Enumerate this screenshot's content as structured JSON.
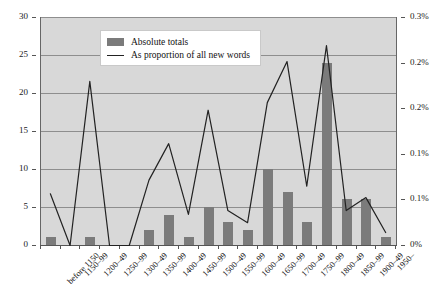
{
  "chart_data": {
    "type": "bar",
    "title": "",
    "subtitle": "",
    "xlabel": "",
    "ylabel": "",
    "y2label": "",
    "grid": true,
    "legend_position": "top-center-inside",
    "categories": [
      "before 1150",
      "1150–99",
      "1200–49",
      "1250–99",
      "1300–49",
      "1350–99",
      "1400–49",
      "1450–99",
      "1500–49",
      "1550–99",
      "1600–49",
      "1650–99",
      "1700–49",
      "1750–99",
      "1800–49",
      "1850–99",
      "1900–49",
      "1950–"
    ],
    "ylim": [
      0,
      30
    ],
    "yticks": [
      0,
      5,
      10,
      15,
      20,
      25,
      30
    ],
    "yticklabels": [
      "0",
      "5",
      "10",
      "15",
      "20",
      "25",
      "30"
    ],
    "y2lim": [
      0,
      0.3
    ],
    "y2ticks": [
      0,
      0.05,
      0.1,
      0.15,
      0.2,
      0.25,
      0.3
    ],
    "y2ticklabels": [
      "0%",
      "0.1%",
      "0.1%",
      "0.2%",
      "0.2%",
      "0.3%"
    ],
    "series": [
      {
        "name": "Absolute totals",
        "type": "bar",
        "axis": "left",
        "color": "#7b7b7b",
        "values": [
          1,
          0,
          1,
          0,
          0,
          2,
          4,
          1,
          5,
          3,
          2,
          10,
          7,
          3,
          24,
          6,
          6,
          1
        ]
      },
      {
        "name": "As proportion of all new words",
        "type": "line",
        "axis": "right",
        "color": "#222222",
        "values_left_scale": [
          6.8,
          0,
          21.6,
          0,
          0,
          8.6,
          13.4,
          4.1,
          17.8,
          4.6,
          3.0,
          18.8,
          24.2,
          7.8,
          26.3,
          4.6,
          6.3,
          1.7
        ],
        "values": [
          0.068,
          0.0,
          0.216,
          0.0,
          0.0,
          0.086,
          0.134,
          0.041,
          0.178,
          0.046,
          0.03,
          0.188,
          0.242,
          0.078,
          0.263,
          0.046,
          0.063,
          0.017
        ]
      }
    ]
  },
  "legend": {
    "items": [
      {
        "label": "Absolute totals",
        "marker": "bar-swatch"
      },
      {
        "label": "As proportion of all new words",
        "marker": "line-swatch"
      }
    ]
  },
  "colors": {
    "bar_fill": "#7b7b7b",
    "line_stroke": "#222222",
    "plot_background": "#d8d8d8",
    "gridline": "#8e8e8e",
    "axis": "#555555",
    "page_background": "#ffffff"
  }
}
